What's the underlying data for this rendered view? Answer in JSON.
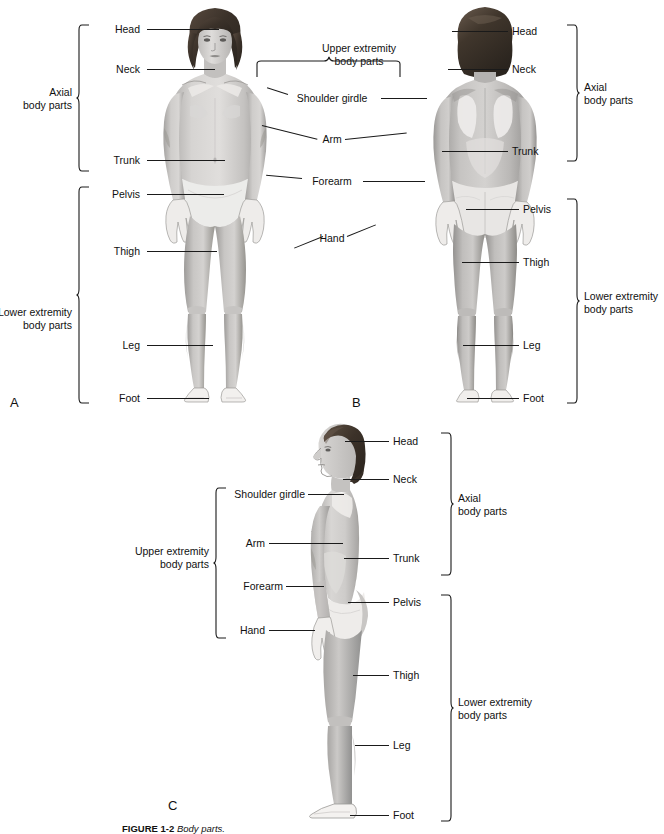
{
  "figure": {
    "caption_bold": "FIGURE 1-2",
    "caption_rest": "Body parts.",
    "panels": [
      {
        "id": "A",
        "view": "anterior"
      },
      {
        "id": "B",
        "view": "posterior"
      },
      {
        "id": "C",
        "view": "lateral"
      }
    ]
  },
  "panelA": {
    "id": "A",
    "labels": {
      "head": "Head",
      "neck": "Neck",
      "trunk": "Trunk",
      "pelvis": "Pelvis",
      "thigh": "Thigh",
      "leg": "Leg",
      "foot": "Foot"
    },
    "groups": {
      "axial": "Axial\nbody parts",
      "lower": "Lower extremity\nbody parts"
    }
  },
  "panelB": {
    "id": "B",
    "labels": {
      "head": "Head",
      "neck": "Neck",
      "trunk": "Trunk",
      "pelvis": "Pelvis",
      "thigh": "Thigh",
      "leg": "Leg",
      "foot": "Foot"
    },
    "groups": {
      "axial": "Axial\nbody parts",
      "lower": "Lower extremity\nbody parts"
    }
  },
  "shared_upper": {
    "group": "Upper extremity\nbody parts",
    "labels": {
      "shoulder_girdle": "Shoulder girdle",
      "arm": "Arm",
      "forearm": "Forearm",
      "hand": "Hand"
    }
  },
  "panelC": {
    "id": "C",
    "labels": {
      "head": "Head",
      "neck": "Neck",
      "shoulder_girdle": "Shoulder girdle",
      "arm": "Arm",
      "forearm": "Forearm",
      "hand": "Hand",
      "trunk": "Trunk",
      "pelvis": "Pelvis",
      "thigh": "Thigh",
      "leg": "Leg",
      "foot": "Foot"
    },
    "groups": {
      "axial": "Axial\nbody parts",
      "upper": "Upper extremity\nbody parts",
      "lower": "Lower extremity\nbody parts"
    }
  },
  "colors": {
    "hair": "#3d332b",
    "skin_light": "#e3e1df",
    "skin_mid": "#c9c7c5",
    "skin_dark": "#a9a7a5",
    "skin_shadow": "#8f8d8b",
    "outline": "#6a6a6a",
    "leader": "#1a1a1a",
    "text": "#111111"
  }
}
